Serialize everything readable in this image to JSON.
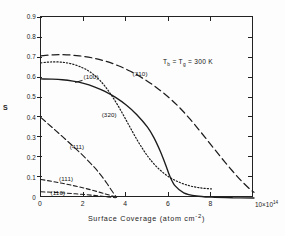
{
  "chart_data": {
    "type": "line",
    "title": "",
    "xlabel": "Surface  Coverage  (atom cm⁻²)",
    "ylabel": "S",
    "x_exponent_label": "10×10¹⁴",
    "xlim": [
      0,
      10
    ],
    "ylim": [
      0,
      0.9
    ],
    "xticks": [
      "0",
      "2",
      "4",
      "6",
      "8"
    ],
    "yticks": [
      "0.9",
      "0.8",
      "0.7",
      "0.6",
      "0.5",
      "0.4",
      "0.3",
      "0.2",
      "0.1",
      "0"
    ],
    "grid": false,
    "legend": "inline-labels",
    "annotation": "Tᵦ = Tᵧ = 300 K",
    "annotation_parts": {
      "t1": "T",
      "sub1": "b",
      "eq1": " = ",
      "t2": "T",
      "sub2": "g",
      "eq2": " = 300 K"
    },
    "series": [
      {
        "name": "(100)",
        "style": "solid",
        "label_x": 2.0,
        "label_y": 0.6,
        "points": [
          [
            0,
            0.592
          ],
          [
            0.5,
            0.591
          ],
          [
            1.0,
            0.588
          ],
          [
            1.5,
            0.581
          ],
          [
            2.0,
            0.57
          ],
          [
            2.5,
            0.553
          ],
          [
            3.0,
            0.53
          ],
          [
            3.5,
            0.5
          ],
          [
            4.0,
            0.462
          ],
          [
            4.5,
            0.414
          ],
          [
            5.0,
            0.352
          ],
          [
            5.3,
            0.3
          ],
          [
            5.6,
            0.232
          ],
          [
            5.85,
            0.165
          ],
          [
            6.05,
            0.108
          ],
          [
            6.3,
            0.06
          ],
          [
            6.7,
            0.026
          ],
          [
            7.3,
            0.01
          ],
          [
            8.0,
            0.004
          ],
          [
            9.0,
            0.001
          ],
          [
            10,
            0.0
          ]
        ]
      },
      {
        "name": "(310)",
        "style": "dashed",
        "label_x": 4.3,
        "label_y": 0.615,
        "points": [
          [
            0,
            0.707
          ],
          [
            0.6,
            0.712
          ],
          [
            1.2,
            0.712
          ],
          [
            1.8,
            0.707
          ],
          [
            2.4,
            0.697
          ],
          [
            3.0,
            0.681
          ],
          [
            3.6,
            0.659
          ],
          [
            4.2,
            0.63
          ],
          [
            4.8,
            0.594
          ],
          [
            5.4,
            0.551
          ],
          [
            6.0,
            0.5
          ],
          [
            6.5,
            0.45
          ],
          [
            7.0,
            0.392
          ],
          [
            7.5,
            0.328
          ],
          [
            8.0,
            0.262
          ],
          [
            8.5,
            0.196
          ],
          [
            9.0,
            0.133
          ],
          [
            9.4,
            0.086
          ],
          [
            9.8,
            0.045
          ],
          [
            10,
            0.028
          ]
        ]
      },
      {
        "name": "(320)",
        "style": "dotted",
        "label_x": 2.85,
        "label_y": 0.415,
        "points": [
          [
            0,
            0.672
          ],
          [
            0.4,
            0.676
          ],
          [
            0.9,
            0.676
          ],
          [
            1.4,
            0.668
          ],
          [
            1.9,
            0.65
          ],
          [
            2.3,
            0.627
          ],
          [
            2.7,
            0.592
          ],
          [
            3.0,
            0.556
          ],
          [
            3.3,
            0.512
          ],
          [
            3.6,
            0.462
          ],
          [
            3.9,
            0.406
          ],
          [
            4.2,
            0.348
          ],
          [
            4.5,
            0.291
          ],
          [
            4.8,
            0.24
          ],
          [
            5.1,
            0.195
          ],
          [
            5.5,
            0.148
          ],
          [
            6.0,
            0.105
          ],
          [
            6.5,
            0.078
          ],
          [
            7.0,
            0.06
          ],
          [
            7.5,
            0.05
          ],
          [
            8.0,
            0.045
          ]
        ]
      },
      {
        "name": "(411)",
        "style": "dashdot",
        "label_x": 1.35,
        "label_y": 0.255,
        "points": [
          [
            0,
            0.4
          ],
          [
            0.5,
            0.353
          ],
          [
            1.0,
            0.306
          ],
          [
            1.5,
            0.258
          ],
          [
            2.0,
            0.208
          ],
          [
            2.5,
            0.153
          ],
          [
            2.8,
            0.115
          ],
          [
            3.1,
            0.072
          ],
          [
            3.35,
            0.032
          ],
          [
            3.55,
            0.003
          ]
        ]
      },
      {
        "name": "(111)",
        "style": "dashed-short",
        "label_x": 0.85,
        "label_y": 0.095,
        "points": [
          [
            0,
            0.092
          ],
          [
            0.5,
            0.083
          ],
          [
            1.0,
            0.073
          ],
          [
            1.5,
            0.062
          ],
          [
            2.0,
            0.05
          ],
          [
            2.5,
            0.036
          ],
          [
            3.0,
            0.021
          ],
          [
            3.4,
            0.008
          ],
          [
            3.6,
            0.0
          ]
        ]
      },
      {
        "name": "(110)",
        "style": "dashed-short",
        "label_x": 0.45,
        "label_y": 0.025,
        "points": [
          [
            0,
            0.031
          ],
          [
            0.8,
            0.027
          ],
          [
            1.6,
            0.021
          ],
          [
            2.4,
            0.014
          ],
          [
            3.0,
            0.007
          ],
          [
            3.5,
            0.001
          ]
        ]
      }
    ]
  },
  "axes": {
    "y_title": "S",
    "x_title": "Surface  Coverage  (atom cm",
    "x_title_sup": "-2",
    "x_title_tail": ")",
    "x_exp_mantissa": "10×10",
    "x_exp_power": "14",
    "x_last_tick": "0"
  }
}
